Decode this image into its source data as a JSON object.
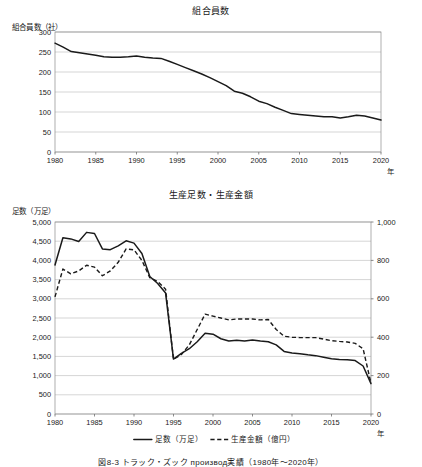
{
  "figure": {
    "caption": "図8-3 トラック・ズック производ実績（1980年〜2020年）"
  },
  "top_chart": {
    "title": "組合員数",
    "ylabel": "組合員数（社）",
    "xlabel": "年"
  },
  "bottom_chart": {
    "title": "生産足数・生産金額",
    "ylabel": "足数（万足）",
    "xlabel": "年",
    "legend": [
      {
        "label": "足数（万足）",
        "style": "solid"
      },
      {
        "label": "生産金額（億円）",
        "style": "dashed"
      }
    ]
  },
  "chart_data": [
    {
      "id": "union-members",
      "type": "line",
      "title": "組合員数",
      "xlabel": "年",
      "ylabel": "組合員数（社）",
      "grid": true,
      "legend_position": "none",
      "xlim": [
        1980,
        2020
      ],
      "ylim": [
        0,
        300
      ],
      "xticks": [
        1980,
        1985,
        1990,
        1995,
        2000,
        2005,
        2010,
        2015,
        2020
      ],
      "yticks": [
        0,
        50,
        100,
        150,
        200,
        250,
        300
      ],
      "ytick_labels": [
        "0",
        "50",
        "100",
        "150",
        "200",
        "250",
        "300"
      ],
      "series": [
        {
          "name": "組合員数（社）",
          "style": "solid",
          "x": [
            1980,
            1981,
            1982,
            1983,
            1984,
            1985,
            1986,
            1987,
            1988,
            1989,
            1990,
            1991,
            1992,
            1993,
            1994,
            1995,
            1996,
            1997,
            1998,
            1999,
            2000,
            2001,
            2002,
            2003,
            2004,
            2005,
            2006,
            2007,
            2008,
            2009,
            2010,
            2011,
            2012,
            2013,
            2014,
            2015,
            2016,
            2017,
            2018,
            2019,
            2020
          ],
          "values": [
            272,
            262,
            251,
            248,
            245,
            242,
            238,
            237,
            237,
            238,
            240,
            237,
            235,
            234,
            227,
            219,
            211,
            203,
            195,
            186,
            176,
            166,
            152,
            147,
            138,
            127,
            121,
            112,
            104,
            96,
            94,
            92,
            90,
            88,
            88,
            85,
            88,
            92,
            90,
            85,
            80
          ]
        }
      ]
    },
    {
      "id": "production",
      "type": "line",
      "title": "生産足数・生産金額",
      "xlabel": "年",
      "ylabel_left": "足数（万足）",
      "ylabel_right": "",
      "grid": true,
      "legend_position": "bottom",
      "xlim": [
        1980,
        2020
      ],
      "ylim_left": [
        0,
        5000
      ],
      "ylim_right": [
        0,
        1000
      ],
      "xticks": [
        1980,
        1985,
        1990,
        1995,
        2000,
        2005,
        2010,
        2015,
        2020
      ],
      "yticks_left": [
        0,
        500,
        1000,
        1500,
        2000,
        2500,
        3000,
        3500,
        4000,
        4500,
        5000
      ],
      "ytick_labels_left": [
        "0",
        "500",
        "1,000",
        "1,500",
        "2,000",
        "2,500",
        "3,000",
        "3,500",
        "4,000",
        "4,500",
        "5,000"
      ],
      "yticks_right": [
        0,
        200,
        400,
        600,
        800,
        1000
      ],
      "ytick_labels_right": [
        "0",
        "200",
        "400",
        "600",
        "800",
        "1,000"
      ],
      "series": [
        {
          "name": "足数（万足）",
          "style": "solid",
          "axis": "left",
          "x": [
            1980,
            1981,
            1982,
            1983,
            1984,
            1985,
            1986,
            1987,
            1988,
            1989,
            1990,
            1991,
            1992,
            1993,
            1994,
            1995,
            1996,
            1997,
            1998,
            1999,
            2000,
            2001,
            2002,
            2003,
            2004,
            2005,
            2006,
            2007,
            2008,
            2009,
            2010,
            2011,
            2012,
            2013,
            2014,
            2015,
            2016,
            2017,
            2018,
            2019,
            2020
          ],
          "values": [
            3880,
            4590,
            4560,
            4490,
            4730,
            4700,
            4300,
            4280,
            4380,
            4510,
            4450,
            4180,
            3580,
            3400,
            3150,
            1430,
            1580,
            1700,
            1880,
            2100,
            2080,
            1960,
            1900,
            1920,
            1900,
            1930,
            1900,
            1880,
            1800,
            1630,
            1590,
            1570,
            1540,
            1520,
            1480,
            1440,
            1420,
            1410,
            1390,
            1250,
            790
          ]
        },
        {
          "name": "生産金額（億円）",
          "style": "dashed",
          "axis": "right",
          "x": [
            1980,
            1981,
            1982,
            1983,
            1984,
            1985,
            1986,
            1987,
            1988,
            1989,
            1990,
            1991,
            1992,
            1993,
            1994,
            1995,
            1996,
            1997,
            1998,
            1999,
            2000,
            2001,
            2002,
            2003,
            2004,
            2005,
            2006,
            2007,
            2008,
            2009,
            2010,
            2011,
            2012,
            2013,
            2014,
            2015,
            2016,
            2017,
            2018,
            2019,
            2020
          ],
          "values": [
            610,
            755,
            730,
            745,
            775,
            765,
            720,
            745,
            790,
            860,
            855,
            800,
            710,
            690,
            650,
            285,
            310,
            360,
            440,
            520,
            510,
            500,
            490,
            495,
            495,
            495,
            490,
            492,
            440,
            405,
            400,
            398,
            398,
            398,
            390,
            382,
            378,
            375,
            368,
            340,
            160
          ]
        }
      ]
    }
  ]
}
